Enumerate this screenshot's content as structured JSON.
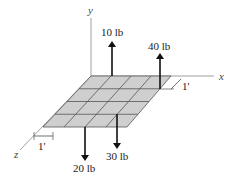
{
  "diagram": {
    "type": "3D force system on rectangular plate",
    "axes": {
      "x": "x",
      "y": "y",
      "z": "z"
    },
    "grid": {
      "rows": 4,
      "cols": 4,
      "fill": "#cfcfcf",
      "line": "#555555"
    },
    "spacing_label_x": "1'",
    "spacing_label_z": "1'",
    "forces": [
      {
        "label": "10 lb",
        "direction": "up"
      },
      {
        "label": "40 lb",
        "direction": "up"
      },
      {
        "label": "20 lb",
        "direction": "down"
      },
      {
        "label": "30 lb",
        "direction": "down"
      }
    ]
  }
}
